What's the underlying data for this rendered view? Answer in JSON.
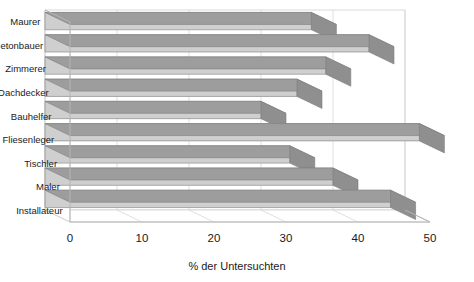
{
  "chart_data": {
    "type": "bar",
    "orientation": "horizontal",
    "style": "3d",
    "title": "",
    "xlabel": "% der Untersuchten",
    "ylabel": "",
    "categories": [
      "Maurer",
      "Betonbauer",
      "Zimmerer",
      "Dachdecker",
      "Bauhelfer",
      "Fliesenleger",
      "Tischler",
      "Maler",
      "Installateur"
    ],
    "values": [
      37,
      45,
      39,
      35,
      30,
      52,
      34,
      40,
      48
    ],
    "xlim": [
      0,
      50
    ],
    "xticks": [
      0,
      10,
      20,
      30,
      40,
      50
    ],
    "xtick_labels": [
      "0",
      "10",
      "20",
      "30",
      "40",
      "50"
    ],
    "grid": true,
    "legend": false,
    "colors": {
      "bar_front": "#cfcfcf",
      "bar_top": "#9d9d9d",
      "bar_side": "#8f8f8f",
      "bar_edge": "#7d7d7d",
      "wall_back": "#ffffff",
      "wall_floor": "#ffffff",
      "grid_line": "#d8d8d8",
      "axis_line": "#b5b5b5",
      "text": "#1a1a1a",
      "background": "#ffffff"
    }
  },
  "axis": {
    "x_title": "% der Untersuchten"
  }
}
